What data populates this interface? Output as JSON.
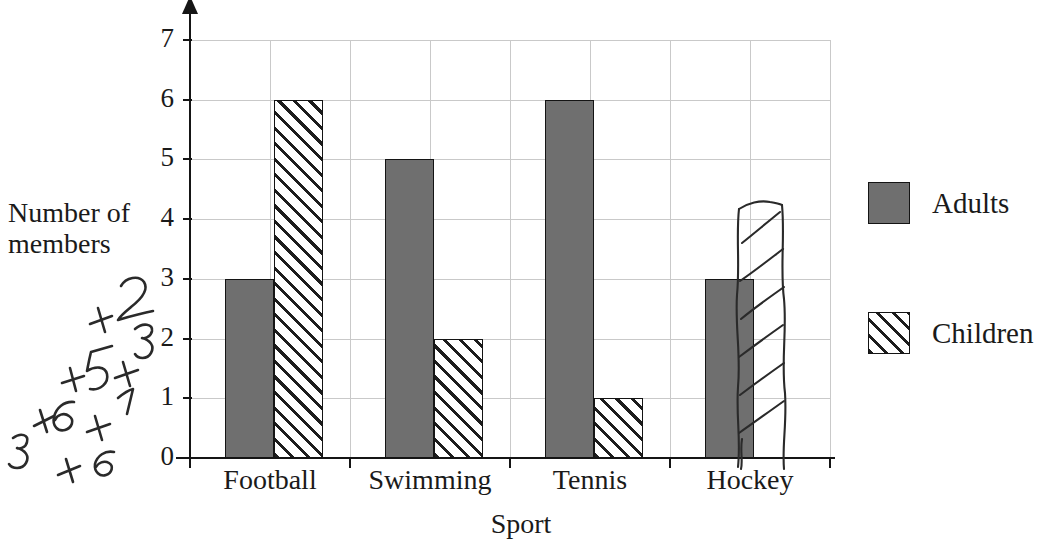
{
  "chart_data": {
    "type": "bar",
    "title": "",
    "xlabel": "Sport",
    "ylabel": "Number of members",
    "categories": [
      "Football",
      "Swimming",
      "Tennis",
      "Hockey"
    ],
    "series": [
      {
        "name": "Adults",
        "values": [
          3,
          5,
          6,
          3
        ]
      },
      {
        "name": "Children",
        "values": [
          6,
          2,
          1,
          4
        ]
      }
    ],
    "ylim": [
      0,
      7
    ],
    "yticks": [
      0,
      1,
      2,
      3,
      4,
      5,
      6,
      7
    ],
    "grid": "both",
    "legend_position": "right",
    "annotations": [
      {
        "kind": "handwriting",
        "text": "3+6+5+2 +6+1+3",
        "lines": [
          "3+6+5+2",
          "+6+1+3"
        ],
        "position": "left-margin",
        "rotated": true
      },
      {
        "kind": "hand-drawn-bar",
        "category": "Hockey",
        "series": "Children",
        "value": 4
      }
    ]
  },
  "axis": {
    "y_title_line1": "Number of",
    "y_title_line2": "members",
    "x_title": "Sport",
    "y_ticks": [
      "0",
      "1",
      "2",
      "3",
      "4",
      "5",
      "6",
      "7"
    ],
    "x_ticks": [
      "Football",
      "Swimming",
      "Tennis",
      "Hockey"
    ]
  },
  "legend": {
    "items": [
      {
        "label": "Adults",
        "swatch": "solid-gray-swatch"
      },
      {
        "label": "Children",
        "swatch": "hatched-swatch"
      }
    ]
  },
  "colors": {
    "adults_fill": "#6f6f6f",
    "children_fill": "#ffffff",
    "hatch": "#1d1d1d",
    "outline": "#141414",
    "gridline": "#c9c9c9",
    "axis": "#151515",
    "ink": "#2a2a2a"
  }
}
